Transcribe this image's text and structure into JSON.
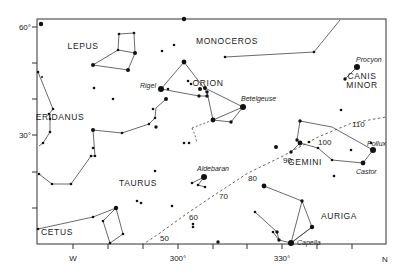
{
  "chart_data": {
    "type": "star-map",
    "title": "",
    "frame": {
      "left": 37,
      "top": 19,
      "right": 386,
      "bottom": 244
    },
    "axes": {
      "x": {
        "ticks": [
          {
            "x": 73,
            "label": "W"
          },
          {
            "x": 108,
            "label": ""
          },
          {
            "x": 143,
            "label": ""
          },
          {
            "x": 178,
            "label": "300°"
          },
          {
            "x": 213,
            "label": ""
          },
          {
            "x": 247,
            "label": ""
          },
          {
            "x": 282,
            "label": "330°"
          },
          {
            "x": 317,
            "label": ""
          },
          {
            "x": 352,
            "label": ""
          }
        ],
        "end_label": "N"
      },
      "y": {
        "ticks": [
          {
            "y": 27,
            "label": "60°"
          },
          {
            "y": 63,
            "label": ""
          },
          {
            "y": 99,
            "label": ""
          },
          {
            "y": 135,
            "label": "30°"
          },
          {
            "y": 172,
            "label": ""
          },
          {
            "y": 208,
            "label": ""
          }
        ]
      }
    },
    "constellations": [
      {
        "name": "LEPUS",
        "x": 83,
        "y": 49
      },
      {
        "name": "MONOCEROS",
        "x": 227,
        "y": 44
      },
      {
        "name": "ORION",
        "x": 208,
        "y": 86
      },
      {
        "name": "CANIS",
        "x": 362,
        "y": 79
      },
      {
        "name": "MINOR",
        "x": 362,
        "y": 88
      },
      {
        "name": "ERIDANUS",
        "x": 60,
        "y": 120
      },
      {
        "name": "GEMINI",
        "x": 305,
        "y": 165
      },
      {
        "name": "TAURUS",
        "x": 138,
        "y": 186
      },
      {
        "name": "AURIGA",
        "x": 339,
        "y": 219
      },
      {
        "name": "CETUS",
        "x": 57,
        "y": 235
      }
    ],
    "named_stars": [
      {
        "name": "Rigel",
        "x": 161,
        "y": 89,
        "label_x": 140,
        "label_y": 88
      },
      {
        "name": "Betelgeuse",
        "x": 243,
        "y": 107,
        "label_x": 241,
        "label_y": 101
      },
      {
        "name": "Procyon",
        "x": 357,
        "y": 67,
        "label_x": 356,
        "label_y": 62
      },
      {
        "name": "Pollux",
        "x": 373,
        "y": 150,
        "label_x": 367,
        "label_y": 146
      },
      {
        "name": "Castor",
        "x": 363,
        "y": 163,
        "label_x": 356,
        "label_y": 174
      },
      {
        "name": "Aldebaran",
        "x": 204,
        "y": 177,
        "label_x": 197,
        "label_y": 171
      },
      {
        "name": "Capella",
        "x": 291,
        "y": 243,
        "label_x": 297,
        "label_y": 245
      }
    ],
    "ecliptic_labels": [
      {
        "label": "50",
        "x": 160,
        "y": 241
      },
      {
        "label": "60",
        "x": 189,
        "y": 220
      },
      {
        "label": "70",
        "x": 219,
        "y": 199
      },
      {
        "label": "80",
        "x": 248,
        "y": 181
      },
      {
        "label": "90",
        "x": 283,
        "y": 163
      },
      {
        "label": "100",
        "x": 318,
        "y": 145
      },
      {
        "label": "110",
        "x": 352,
        "y": 127
      }
    ],
    "ecliptic_path": [
      [
        142,
        245
      ],
      [
        160,
        233
      ],
      [
        189,
        212
      ],
      [
        219,
        192
      ],
      [
        248,
        173
      ],
      [
        283,
        156
      ],
      [
        318,
        137
      ],
      [
        352,
        123
      ],
      [
        386,
        117
      ]
    ],
    "orion_belt_ext": [
      [
        192,
        128
      ],
      [
        243,
        120
      ]
    ],
    "stars": [
      {
        "x": 41,
        "y": 24,
        "r": 2.2
      },
      {
        "x": 184,
        "y": 19,
        "r": 2.2
      },
      {
        "x": 119,
        "y": 34,
        "r": 1.3
      },
      {
        "x": 134,
        "y": 33,
        "r": 1.3
      },
      {
        "x": 135,
        "y": 53,
        "r": 2.0
      },
      {
        "x": 118,
        "y": 50,
        "r": 1.3
      },
      {
        "x": 93,
        "y": 65,
        "r": 2.0
      },
      {
        "x": 128,
        "y": 70,
        "r": 2.0
      },
      {
        "x": 162,
        "y": 51,
        "r": 1.3
      },
      {
        "x": 174,
        "y": 45,
        "r": 1.3
      },
      {
        "x": 184,
        "y": 62,
        "r": 2.4
      },
      {
        "x": 225,
        "y": 57,
        "r": 1.3
      },
      {
        "x": 314,
        "y": 52,
        "r": 1.3
      },
      {
        "x": 357,
        "y": 67,
        "r": 3.0
      },
      {
        "x": 345,
        "y": 79,
        "r": 1.7
      },
      {
        "x": 161,
        "y": 89,
        "r": 3.0
      },
      {
        "x": 168,
        "y": 89,
        "r": 1.3
      },
      {
        "x": 188,
        "y": 81,
        "r": 1.3
      },
      {
        "x": 191,
        "y": 84,
        "r": 1.3
      },
      {
        "x": 199,
        "y": 96,
        "r": 1.7
      },
      {
        "x": 200,
        "y": 89,
        "r": 2.0
      },
      {
        "x": 205,
        "y": 88,
        "r": 2.0
      },
      {
        "x": 207,
        "y": 92,
        "r": 1.7
      },
      {
        "x": 207,
        "y": 96,
        "r": 1.7
      },
      {
        "x": 166,
        "y": 99,
        "r": 2.0
      },
      {
        "x": 213,
        "y": 120,
        "r": 2.4
      },
      {
        "x": 243,
        "y": 107,
        "r": 3.0
      },
      {
        "x": 231,
        "y": 122,
        "r": 1.7
      },
      {
        "x": 94,
        "y": 88,
        "r": 1.3
      },
      {
        "x": 113,
        "y": 99,
        "r": 1.3
      },
      {
        "x": 153,
        "y": 109,
        "r": 1.3
      },
      {
        "x": 155,
        "y": 118,
        "r": 1.3
      },
      {
        "x": 149,
        "y": 124,
        "r": 1.3
      },
      {
        "x": 156,
        "y": 127,
        "r": 1.7
      },
      {
        "x": 93,
        "y": 130,
        "r": 2.0
      },
      {
        "x": 122,
        "y": 133,
        "r": 1.3
      },
      {
        "x": 38,
        "y": 72,
        "r": 1.3
      },
      {
        "x": 42,
        "y": 77,
        "r": 1.0
      },
      {
        "x": 53,
        "y": 109,
        "r": 1.3
      },
      {
        "x": 49,
        "y": 114,
        "r": 1.3
      },
      {
        "x": 50,
        "y": 119,
        "r": 1.3
      },
      {
        "x": 50,
        "y": 132,
        "r": 1.3
      },
      {
        "x": 43,
        "y": 143,
        "r": 1.3
      },
      {
        "x": 95,
        "y": 156,
        "r": 1.3
      },
      {
        "x": 91,
        "y": 156,
        "r": 1.3
      },
      {
        "x": 39,
        "y": 174,
        "r": 1.3
      },
      {
        "x": 52,
        "y": 184,
        "r": 1.3
      },
      {
        "x": 71,
        "y": 184,
        "r": 1.3
      },
      {
        "x": 93,
        "y": 148,
        "r": 1.3
      },
      {
        "x": 184,
        "y": 143,
        "r": 1.3
      },
      {
        "x": 189,
        "y": 143,
        "r": 1.3
      },
      {
        "x": 155,
        "y": 171,
        "r": 1.3
      },
      {
        "x": 204,
        "y": 177,
        "r": 3.0
      },
      {
        "x": 192,
        "y": 183,
        "r": 1.3
      },
      {
        "x": 198,
        "y": 185,
        "r": 1.3
      },
      {
        "x": 205,
        "y": 187,
        "r": 1.3
      },
      {
        "x": 137,
        "y": 201,
        "r": 1.3
      },
      {
        "x": 141,
        "y": 203,
        "r": 1.3
      },
      {
        "x": 172,
        "y": 206,
        "r": 1.3
      },
      {
        "x": 193,
        "y": 224,
        "r": 1.3
      },
      {
        "x": 193,
        "y": 227,
        "r": 1.3
      },
      {
        "x": 218,
        "y": 242,
        "r": 1.7
      },
      {
        "x": 276,
        "y": 147,
        "r": 2.0
      },
      {
        "x": 300,
        "y": 121,
        "r": 1.7
      },
      {
        "x": 309,
        "y": 142,
        "r": 1.3
      },
      {
        "x": 341,
        "y": 110,
        "r": 1.3
      },
      {
        "x": 300,
        "y": 143,
        "r": 2.4
      },
      {
        "x": 291,
        "y": 152,
        "r": 1.7
      },
      {
        "x": 297,
        "y": 140,
        "r": 1.7
      },
      {
        "x": 318,
        "y": 148,
        "r": 1.3
      },
      {
        "x": 332,
        "y": 160,
        "r": 1.3
      },
      {
        "x": 351,
        "y": 150,
        "r": 1.3
      },
      {
        "x": 363,
        "y": 163,
        "r": 2.4
      },
      {
        "x": 373,
        "y": 150,
        "r": 3.0
      },
      {
        "x": 371,
        "y": 143,
        "r": 1.3
      },
      {
        "x": 334,
        "y": 176,
        "r": 1.3
      },
      {
        "x": 264,
        "y": 186,
        "r": 2.4
      },
      {
        "x": 302,
        "y": 201,
        "r": 1.7
      },
      {
        "x": 312,
        "y": 227,
        "r": 2.2
      },
      {
        "x": 255,
        "y": 212,
        "r": 1.3
      },
      {
        "x": 273,
        "y": 232,
        "r": 1.3
      },
      {
        "x": 277,
        "y": 232,
        "r": 1.7
      },
      {
        "x": 279,
        "y": 240,
        "r": 1.7
      },
      {
        "x": 291,
        "y": 243,
        "r": 3.0
      },
      {
        "x": 38,
        "y": 229,
        "r": 1.3
      },
      {
        "x": 93,
        "y": 217,
        "r": 1.3
      },
      {
        "x": 116,
        "y": 208,
        "r": 2.2
      },
      {
        "x": 103,
        "y": 221,
        "r": 1.3
      },
      {
        "x": 123,
        "y": 234,
        "r": 1.3
      },
      {
        "x": 110,
        "y": 243,
        "r": 1.3
      }
    ],
    "lines": [
      [
        [
          119,
          34
        ],
        [
          134,
          33
        ],
        [
          135,
          53
        ],
        [
          118,
          50
        ],
        [
          119,
          34
        ]
      ],
      [
        [
          135,
          53
        ],
        [
          128,
          70
        ],
        [
          93,
          65
        ],
        [
          118,
          50
        ]
      ],
      [
        [
          225,
          57
        ],
        [
          314,
          52
        ],
        [
          340,
          20
        ]
      ],
      [
        [
          357,
          67
        ],
        [
          345,
          79
        ]
      ],
      [
        [
          161,
          89
        ],
        [
          184,
          62
        ],
        [
          207,
          92
        ],
        [
          213,
          120
        ],
        [
          243,
          107
        ],
        [
          205,
          88
        ]
      ],
      [
        [
          161,
          89
        ],
        [
          199,
          96
        ],
        [
          207,
          96
        ]
      ],
      [
        [
          213,
          120
        ],
        [
          231,
          122
        ],
        [
          243,
          107
        ]
      ],
      [
        [
          38,
          72
        ],
        [
          53,
          109
        ],
        [
          49,
          114
        ],
        [
          50,
          119
        ],
        [
          50,
          132
        ],
        [
          43,
          143
        ],
        [
          39,
          146
        ]
      ],
      [
        [
          166,
          99
        ],
        [
          156,
          108
        ],
        [
          155,
          118
        ],
        [
          149,
          124
        ],
        [
          122,
          133
        ],
        [
          93,
          130
        ],
        [
          95,
          156
        ],
        [
          91,
          156
        ],
        [
          71,
          184
        ],
        [
          52,
          184
        ],
        [
          39,
          174
        ]
      ],
      [
        [
          38,
          229
        ],
        [
          93,
          217
        ],
        [
          116,
          208
        ]
      ],
      [
        [
          116,
          208
        ],
        [
          103,
          221
        ],
        [
          110,
          243
        ],
        [
          123,
          234
        ],
        [
          116,
          208
        ]
      ],
      [
        [
          204,
          177
        ],
        [
          198,
          185
        ],
        [
          205,
          187
        ]
      ],
      [
        [
          192,
          183
        ],
        [
          204,
          177
        ]
      ],
      [
        [
          300,
          121
        ],
        [
          297,
          140
        ],
        [
          300,
          143
        ],
        [
          291,
          152
        ]
      ],
      [
        [
          300,
          143
        ],
        [
          318,
          148
        ],
        [
          332,
          160
        ],
        [
          363,
          163
        ],
        [
          373,
          150
        ]
      ],
      [
        [
          300,
          121
        ],
        [
          332,
          127
        ],
        [
          373,
          150
        ]
      ],
      [
        [
          264,
          186
        ],
        [
          302,
          201
        ],
        [
          312,
          227
        ],
        [
          291,
          243
        ]
      ],
      [
        [
          302,
          201
        ],
        [
          291,
          243
        ]
      ],
      [
        [
          255,
          212
        ],
        [
          277,
          232
        ],
        [
          279,
          240
        ],
        [
          291,
          243
        ]
      ],
      [
        [
          273,
          232
        ],
        [
          279,
          240
        ]
      ],
      [
        [
          291,
          243
        ],
        [
          312,
          227
        ]
      ]
    ],
    "dashed_lines": [
      [
        [
          192,
          128
        ],
        [
          192,
          128
        ],
        [
          213,
          120
        ]
      ],
      [
        [
          192,
          128
        ],
        [
          195,
          135
        ],
        [
          197,
          143
        ]
      ]
    ]
  }
}
